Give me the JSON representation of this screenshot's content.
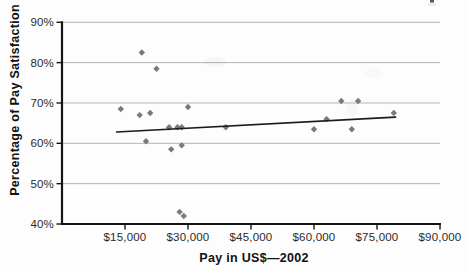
{
  "chart_data": {
    "type": "scatter",
    "title": "",
    "xlabel": "Pay in US$—2002",
    "ylabel": "Percentage of Pay Satisfaction",
    "xlim": [
      0,
      90000
    ],
    "ylim": [
      40,
      90
    ],
    "grid": "horizontal-only",
    "legend": "none",
    "x_ticks": {
      "values": [
        15000,
        30000,
        45000,
        60000,
        75000,
        90000
      ],
      "labels": [
        "$15,000",
        "$30,000",
        "$45,000",
        "$60,000",
        "$75,000",
        "$90,000"
      ]
    },
    "y_ticks": {
      "values": [
        40,
        50,
        60,
        70,
        80,
        90
      ],
      "labels": [
        "40%",
        "50%",
        "60%",
        "70%",
        "80%",
        "90%"
      ]
    },
    "series": [
      {
        "name": "pay-vs-satisfaction",
        "marker": "diamond",
        "points": [
          {
            "x": 14000,
            "y": 68.5
          },
          {
            "x": 18500,
            "y": 67
          },
          {
            "x": 19000,
            "y": 82.5
          },
          {
            "x": 20000,
            "y": 60.5
          },
          {
            "x": 21000,
            "y": 67.5
          },
          {
            "x": 22500,
            "y": 78.5
          },
          {
            "x": 25500,
            "y": 64
          },
          {
            "x": 26000,
            "y": 58.5
          },
          {
            "x": 27500,
            "y": 64
          },
          {
            "x": 28000,
            "y": 43
          },
          {
            "x": 28500,
            "y": 64
          },
          {
            "x": 28500,
            "y": 59.5
          },
          {
            "x": 29000,
            "y": 42
          },
          {
            "x": 30000,
            "y": 69
          },
          {
            "x": 39000,
            "y": 64
          },
          {
            "x": 60000,
            "y": 63.5
          },
          {
            "x": 63000,
            "y": 66
          },
          {
            "x": 66500,
            "y": 70.5
          },
          {
            "x": 69000,
            "y": 63.5
          },
          {
            "x": 70500,
            "y": 70.5
          },
          {
            "x": 79000,
            "y": 67.5
          }
        ]
      }
    ],
    "trendline": {
      "x1": 13000,
      "y1": 62.8,
      "x2": 79400,
      "y2": 66.5
    },
    "colors": {
      "marker": "#6f6f6f",
      "trendline": "#1b1b1b",
      "gridline": "#b4b4b4",
      "axis": "#141414",
      "tick_text": "#2b2b2b",
      "title_text": "#111111",
      "background": "#fdfdfd"
    }
  }
}
